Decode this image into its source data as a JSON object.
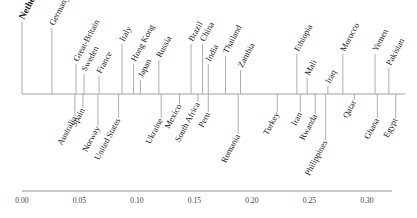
{
  "chart_data": {
    "type": "timeline",
    "title": "",
    "xlabel": "",
    "ylabel": "",
    "xlim": [
      0.0,
      0.32
    ],
    "grid": false,
    "ticks": [
      "0.00",
      "0.05",
      "0.10",
      "0.15",
      "0.20",
      "0.25",
      "0.30"
    ],
    "tick_values": [
      0.0,
      0.05,
      0.1,
      0.15,
      0.2,
      0.25,
      0.3
    ],
    "highlight": "Netherlands",
    "above": [
      {
        "label": "Netherlands",
        "value": 0.0,
        "len": 72
      },
      {
        "label": "Germany",
        "value": 0.026,
        "len": 66
      },
      {
        "label": "Great-Britain",
        "value": 0.047,
        "len": 30
      },
      {
        "label": "Sweden",
        "value": 0.054,
        "len": 20
      },
      {
        "label": "France",
        "value": 0.067,
        "len": 18
      },
      {
        "label": "Italy",
        "value": 0.087,
        "len": 50
      },
      {
        "label": "Hong Kong",
        "value": 0.097,
        "len": 30
      },
      {
        "label": "Japan",
        "value": 0.103,
        "len": 14
      },
      {
        "label": "Russia",
        "value": 0.119,
        "len": 34
      },
      {
        "label": "Brazil",
        "value": 0.147,
        "len": 50
      },
      {
        "label": "China",
        "value": 0.157,
        "len": 50
      },
      {
        "label": "India",
        "value": 0.162,
        "len": 30
      },
      {
        "label": "Thailand",
        "value": 0.177,
        "len": 38
      },
      {
        "label": "Zambia",
        "value": 0.19,
        "len": 24
      },
      {
        "label": "Ethiopia",
        "value": 0.239,
        "len": 40
      },
      {
        "label": "Mali",
        "value": 0.248,
        "len": 16
      },
      {
        "label": "Iraq",
        "value": 0.266,
        "len": 8
      },
      {
        "label": "Morocco",
        "value": 0.279,
        "len": 40
      },
      {
        "label": "Yemen",
        "value": 0.307,
        "len": 40
      },
      {
        "label": "Pakistan",
        "value": 0.319,
        "len": 26
      }
    ],
    "below": [
      {
        "label": "Australia",
        "value": 0.046,
        "len": 22
      },
      {
        "label": "Spain",
        "value": 0.053,
        "len": 14
      },
      {
        "label": "Norway",
        "value": 0.066,
        "len": 32
      },
      {
        "label": "United States",
        "value": 0.084,
        "len": 24
      },
      {
        "label": "Ukraine",
        "value": 0.121,
        "len": 24
      },
      {
        "label": "Mexico",
        "value": 0.137,
        "len": 10
      },
      {
        "label": "South Africa",
        "value": 0.153,
        "len": 8
      },
      {
        "label": "Peru",
        "value": 0.162,
        "len": 18
      },
      {
        "label": "Romania",
        "value": 0.188,
        "len": 40
      },
      {
        "label": "Turkey",
        "value": 0.222,
        "len": 18
      },
      {
        "label": "Iran",
        "value": 0.242,
        "len": 18
      },
      {
        "label": "Rwanda",
        "value": 0.255,
        "len": 20
      },
      {
        "label": "Philippines",
        "value": 0.264,
        "len": 46
      },
      {
        "label": "Qatar",
        "value": 0.289,
        "len": 6
      },
      {
        "label": "Ghana",
        "value": 0.309,
        "len": 24
      },
      {
        "label": "Egypt",
        "value": 0.325,
        "len": 24
      }
    ]
  },
  "colors": {
    "text": "#222222",
    "stem": "#9a9a9a",
    "axis": "#888888",
    "background": "#ffffff"
  }
}
